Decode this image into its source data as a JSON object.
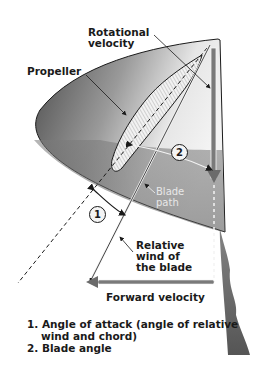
{
  "labels": {
    "rotational_velocity": [
      "Rotational",
      "velocity"
    ],
    "propeller": "Propeller",
    "blade_path": [
      "Blade",
      "path"
    ],
    "relative_wind": [
      "Relative",
      "wind of",
      "the blade"
    ],
    "forward_velocity": "Forward velocity"
  },
  "markers": {
    "angle1": "1",
    "angle2": "2"
  },
  "legend": {
    "item1_line1": "1. Angle of attack (angle of relative",
    "item1_line2": "wind and chord)",
    "item2": "2. Blade angle"
  },
  "colors": {
    "disc_dark": "#555555",
    "disc_light": "#d9d9d9",
    "line": "#1a1a1a",
    "arrow_gray": "#6b6b6b"
  }
}
